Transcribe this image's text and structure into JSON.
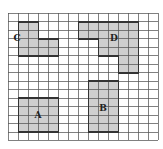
{
  "diagram": {
    "type": "grid-shapes",
    "grid": {
      "columns": 15,
      "rows": 15,
      "line_color": "#555555",
      "fill_color": "#cfcfcf"
    },
    "shapes": [
      {
        "label": "A",
        "cells": [
          [
            1,
            10,
            4,
            4
          ]
        ]
      },
      {
        "label": "B",
        "cells": [
          [
            8,
            8,
            3,
            6
          ]
        ]
      },
      {
        "label": "C",
        "cells": [
          [
            1,
            1,
            2,
            4
          ],
          [
            3,
            3,
            2,
            2
          ]
        ]
      },
      {
        "label": "D",
        "cells": [
          [
            7,
            1,
            6,
            2
          ],
          [
            9,
            3,
            4,
            2
          ],
          [
            11,
            5,
            2,
            2
          ]
        ]
      }
    ]
  }
}
